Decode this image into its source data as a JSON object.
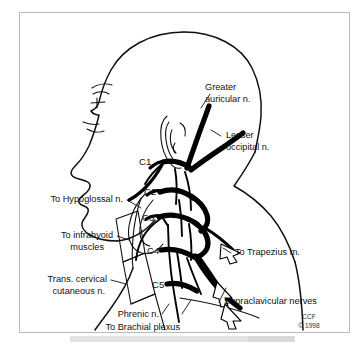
{
  "figure": {
    "frame_color": "#b9b9b9",
    "background_color": "#ffffff",
    "ink_color": "#000000"
  },
  "labels": {
    "greater_auricular": "Greater\nauricular n.",
    "greater_auricular_line1": "Greater",
    "greater_auricular_line2": "auricular n.",
    "lesser_occipital_line1": "Lesser",
    "lesser_occipital_line2": "occipital n.",
    "to_hypoglossal": "To Hypoglossal n.",
    "to_infrahyoid_line1": "To infrahyoid",
    "to_infrahyoid_line2": "muscles",
    "trans_cervical_line1": "Trans. cervical",
    "trans_cervical_line2": "cutaneous n.",
    "phrenic": "Phrenic n.",
    "to_brachial_plexus": "To Brachial plexus",
    "supraclavicular": "Supraclavicular nerves",
    "to_trapezius": "To Trapezius m."
  },
  "nerve_roots": [
    {
      "id": "c1",
      "label": "C1"
    },
    {
      "id": "c2",
      "label": "C2"
    },
    {
      "id": "c3",
      "label": "C3"
    },
    {
      "id": "c4",
      "label": "C4"
    },
    {
      "id": "c5",
      "label": "C5"
    }
  ],
  "credit": {
    "org": "CCF",
    "copyright": "© 1998"
  }
}
